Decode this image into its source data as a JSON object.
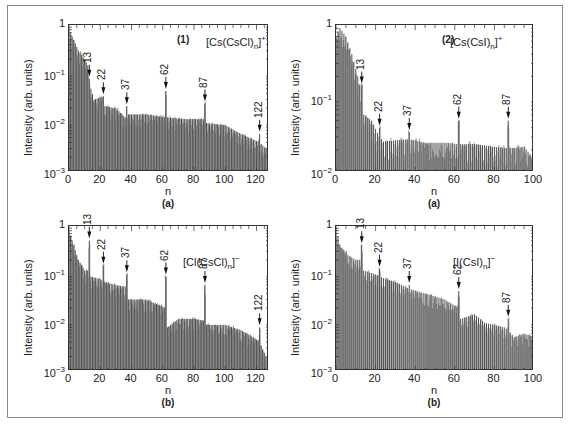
{
  "figure": {
    "frame_color": "#8a8a8a",
    "bar_color": "#555555"
  },
  "chart_data": [
    {
      "id": "tl",
      "type": "bar",
      "panel_number": "(1)",
      "sublabel": "(a)",
      "formula": {
        "prefix": "[Cs(CsCl)",
        "sub": "n",
        "suffix": "]",
        "sup": "+"
      },
      "title": "[Cs(CsCl)n]+",
      "xlabel": "n",
      "ylabel": "Intensity (arb. units)",
      "yscale": "log",
      "ylim": [
        0.001,
        1
      ],
      "xlim": [
        0,
        128
      ],
      "xticks": [
        0,
        20,
        40,
        60,
        80,
        100,
        120
      ],
      "yticks": [
        {
          "base": "1",
          "exp": ""
        },
        {
          "base": "10",
          "exp": "−1"
        },
        {
          "base": "10",
          "exp": "−2"
        },
        {
          "base": "10",
          "exp": "−3"
        }
      ],
      "magic_numbers": [
        13,
        22,
        37,
        62,
        87,
        122
      ],
      "envelope": [
        [
          0,
          0.8
        ],
        [
          3,
          0.5
        ],
        [
          6,
          0.3
        ],
        [
          10,
          0.2
        ],
        [
          12,
          0.15
        ],
        [
          13,
          0.08
        ],
        [
          14,
          0.05
        ],
        [
          16,
          0.03
        ],
        [
          22,
          0.035
        ],
        [
          23,
          0.022
        ],
        [
          30,
          0.02
        ],
        [
          37,
          0.012
        ],
        [
          38,
          0.015
        ],
        [
          50,
          0.015
        ],
        [
          62,
          0.013
        ],
        [
          63,
          0.013
        ],
        [
          75,
          0.012
        ],
        [
          87,
          0.012
        ],
        [
          88,
          0.01
        ],
        [
          100,
          0.009
        ],
        [
          110,
          0.006
        ],
        [
          122,
          0.004
        ],
        [
          126,
          0.003
        ]
      ],
      "peaks": {
        "13": 0.08,
        "22": 0.035,
        "37": 0.022,
        "62": 0.045,
        "87": 0.025,
        "122": 0.006
      }
    },
    {
      "id": "tr",
      "type": "bar",
      "panel_number": "(2)",
      "sublabel": "(a)",
      "formula": {
        "prefix": "[Cs(CsI)",
        "sub": "n",
        "suffix": "]",
        "sup": "+"
      },
      "title": "[Cs(CsI)n]+",
      "xlabel": "n",
      "ylabel": "Intensity (arb. units)",
      "yscale": "log",
      "ylim": [
        0.01,
        1
      ],
      "xlim": [
        0,
        100
      ],
      "xticks": [
        0,
        20,
        40,
        60,
        80,
        100
      ],
      "yticks": [
        {
          "base": "1",
          "exp": ""
        },
        {
          "base": "10",
          "exp": "−1"
        },
        {
          "base": "10",
          "exp": "−2"
        }
      ],
      "magic_numbers": [
        13,
        22,
        37,
        62,
        87
      ],
      "envelope": [
        [
          0,
          0.7
        ],
        [
          2,
          0.9
        ],
        [
          5,
          0.7
        ],
        [
          8,
          0.4
        ],
        [
          11,
          0.2
        ],
        [
          13,
          0.12
        ],
        [
          14,
          0.06
        ],
        [
          18,
          0.05
        ],
        [
          22,
          0.03
        ],
        [
          24,
          0.026
        ],
        [
          30,
          0.027
        ],
        [
          37,
          0.028
        ],
        [
          45,
          0.025
        ],
        [
          55,
          0.025
        ],
        [
          62,
          0.024
        ],
        [
          70,
          0.024
        ],
        [
          80,
          0.022
        ],
        [
          87,
          0.021
        ],
        [
          95,
          0.022
        ],
        [
          100,
          0.015
        ]
      ],
      "peaks": {
        "13": 0.15,
        "22": 0.04,
        "37": 0.035,
        "62": 0.05,
        "87": 0.05
      }
    },
    {
      "id": "bl",
      "type": "bar",
      "panel_number": "",
      "sublabel": "(b)",
      "formula": {
        "prefix": "[Cl(CsCl)",
        "sub": "n",
        "suffix": "]",
        "sup": "−"
      },
      "title": "[Cl(CsCl)n]−",
      "xlabel": "n",
      "ylabel": "Intensity (arb. units)",
      "yscale": "log",
      "ylim": [
        0.001,
        1
      ],
      "xlim": [
        0,
        128
      ],
      "xticks": [
        0,
        20,
        40,
        60,
        80,
        100,
        120
      ],
      "yticks": [
        {
          "base": "1",
          "exp": ""
        },
        {
          "base": "10",
          "exp": "−1"
        },
        {
          "base": "10",
          "exp": "−2"
        },
        {
          "base": "10",
          "exp": "−3"
        }
      ],
      "magic_numbers": [
        13,
        22,
        37,
        62,
        87,
        122
      ],
      "envelope": [
        [
          0,
          0.8
        ],
        [
          3,
          0.4
        ],
        [
          6,
          0.2
        ],
        [
          10,
          0.12
        ],
        [
          13,
          0.12
        ],
        [
          14,
          0.09
        ],
        [
          20,
          0.08
        ],
        [
          22,
          0.07
        ],
        [
          30,
          0.06
        ],
        [
          37,
          0.055
        ],
        [
          38,
          0.03
        ],
        [
          50,
          0.03
        ],
        [
          55,
          0.025
        ],
        [
          62,
          0.02
        ],
        [
          63,
          0.008
        ],
        [
          70,
          0.012
        ],
        [
          80,
          0.012
        ],
        [
          87,
          0.011
        ],
        [
          88,
          0.009
        ],
        [
          100,
          0.009
        ],
        [
          110,
          0.007
        ],
        [
          118,
          0.005
        ],
        [
          122,
          0.004
        ],
        [
          126,
          0.002
        ]
      ],
      "peaks": {
        "13": 0.5,
        "22": 0.15,
        "37": 0.1,
        "62": 0.09,
        "87": 0.06,
        "122": 0.008
      }
    },
    {
      "id": "br",
      "type": "bar",
      "panel_number": "",
      "sublabel": "(b)",
      "formula": {
        "prefix": "[I(CsI)",
        "sub": "n",
        "suffix": "]",
        "sup": "−"
      },
      "title": "[I(CsI)n]−",
      "xlabel": "n",
      "ylabel": "Intensity (arb. units)",
      "yscale": "log",
      "ylim": [
        0.001,
        1
      ],
      "xlim": [
        0,
        100
      ],
      "xticks": [
        0,
        20,
        40,
        60,
        80,
        100
      ],
      "yticks": [
        {
          "base": "1",
          "exp": ""
        },
        {
          "base": "10",
          "exp": "−1"
        },
        {
          "base": "10",
          "exp": "−2"
        },
        {
          "base": "10",
          "exp": "−3"
        }
      ],
      "magic_numbers": [
        13,
        22,
        37,
        62,
        87
      ],
      "envelope": [
        [
          0,
          0.9
        ],
        [
          2,
          0.4
        ],
        [
          6,
          0.25
        ],
        [
          10,
          0.2
        ],
        [
          13,
          0.2
        ],
        [
          14,
          0.12
        ],
        [
          20,
          0.1
        ],
        [
          22,
          0.09
        ],
        [
          25,
          0.08
        ],
        [
          30,
          0.07
        ],
        [
          37,
          0.05
        ],
        [
          45,
          0.04
        ],
        [
          55,
          0.03
        ],
        [
          62,
          0.02
        ],
        [
          63,
          0.012
        ],
        [
          70,
          0.015
        ],
        [
          75,
          0.01
        ],
        [
          85,
          0.008
        ],
        [
          87,
          0.007
        ],
        [
          90,
          0.005
        ],
        [
          95,
          0.006
        ],
        [
          100,
          0.005
        ]
      ],
      "peaks": {
        "13": 0.4,
        "22": 0.13,
        "37": 0.06,
        "62": 0.045,
        "87": 0.012
      }
    }
  ]
}
